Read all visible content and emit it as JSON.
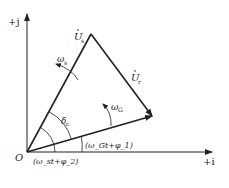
{
  "diagram": {
    "axes": {
      "vertical_label": "+j",
      "horizontal_label": "+i",
      "origin_label": "O"
    },
    "vectors": [
      {
        "name": "U_s",
        "label_base": "U",
        "label_sub": "s",
        "dot": true,
        "from": "O",
        "to": "apex"
      },
      {
        "name": "U_r",
        "label_base": "U",
        "label_sub": "r",
        "dot": true,
        "from": "apex",
        "to": "right"
      },
      {
        "name": "G",
        "from": "O",
        "to": "right"
      }
    ],
    "angles": {
      "omega_s": {
        "base": "ω",
        "sub": "s"
      },
      "omega_G": {
        "base": "ω",
        "sub": "G"
      },
      "delta_c": {
        "base": "δ",
        "sub": "c"
      },
      "phase_1": "(ω_Gt+φ_1)",
      "phase_2": "(ω_st+φ_2)"
    },
    "colors": {
      "line": "#222222",
      "background": "#ffffff"
    }
  }
}
